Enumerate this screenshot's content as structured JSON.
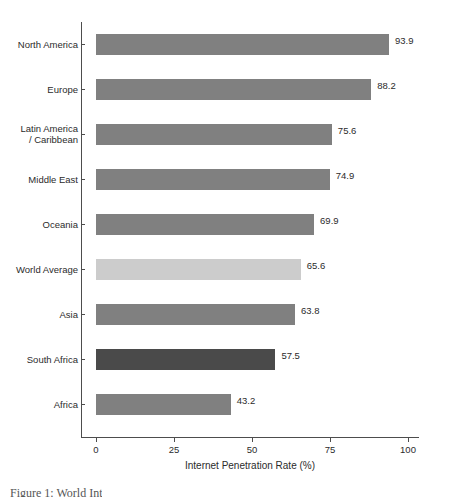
{
  "chart_data": {
    "type": "bar",
    "orientation": "horizontal",
    "title": "",
    "xlabel": "Internet Penetration Rate (%)",
    "ylabel": "",
    "xlim": [
      0,
      100
    ],
    "xticks": [
      0,
      25,
      50,
      75,
      100
    ],
    "xtick_labels": [
      "0",
      "25",
      "50",
      "75",
      "100"
    ],
    "grid": false,
    "legend": "none",
    "categories": [
      "North America",
      "Europe",
      "Latin America\n/ Caribbean",
      "Middle East",
      "Oceania",
      "World Average",
      "Asia",
      "South Africa",
      "Africa"
    ],
    "values": [
      93.9,
      88.2,
      75.6,
      74.9,
      69.9,
      65.6,
      63.8,
      57.5,
      43.2
    ],
    "value_labels": [
      "93.9",
      "88.2",
      "75.6",
      "74.9",
      "69.9",
      "65.6",
      "63.8",
      "57.5",
      "43.2"
    ],
    "bar_colors": [
      "#808080",
      "#808080",
      "#808080",
      "#808080",
      "#808080",
      "#cccccc",
      "#808080",
      "#4a4a4a",
      "#808080"
    ]
  },
  "axis": {
    "line_color": "#4d4d4d"
  },
  "caption": {
    "text": "Figure 1: World Int"
  }
}
